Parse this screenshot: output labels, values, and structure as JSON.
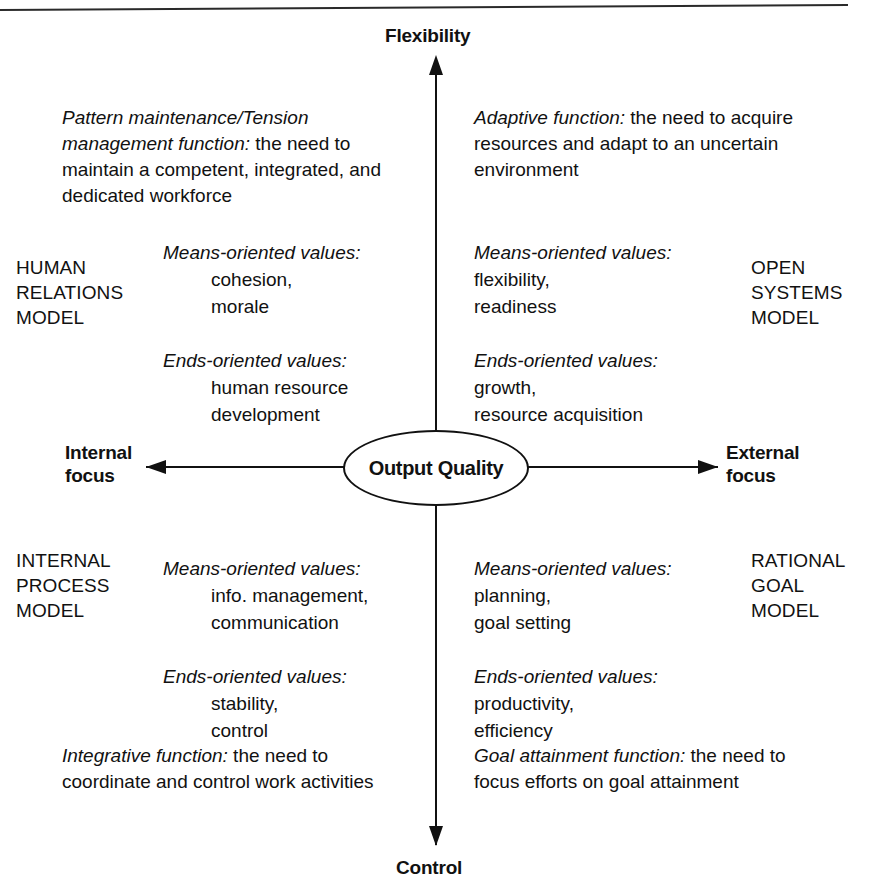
{
  "diagram": {
    "type": "quadrant-diagram",
    "center_node": {
      "label": "Output Quality",
      "shape": "ellipse"
    },
    "axes": {
      "vertical": {
        "top_label": "Flexibility",
        "bottom_label": "Control",
        "arrow_top": true,
        "arrow_bottom": true
      },
      "horizontal": {
        "left_label": "Internal\nfocus",
        "right_label": "External\nfocus",
        "arrow_left": true,
        "arrow_right": true
      }
    },
    "quadrants": {
      "upper_left": {
        "model_name": "HUMAN\nRELATIONS\nMODEL",
        "function": {
          "term": "Pattern maintenance/Tension management function:",
          "description": " the need to maintain a competent, integrated, and dedicated workforce"
        },
        "means_oriented": {
          "heading": "Means-oriented values:",
          "items": [
            "cohesion,",
            "morale"
          ]
        },
        "ends_oriented": {
          "heading": "Ends-oriented values:",
          "items": [
            "human resource",
            "development"
          ]
        }
      },
      "upper_right": {
        "model_name": "OPEN\nSYSTEMS\nMODEL",
        "function": {
          "term": "Adaptive function:",
          "description": " the need to acquire resources and adapt to an uncertain environment"
        },
        "means_oriented": {
          "heading": "Means-oriented values:",
          "items": [
            "flexibility,",
            "readiness"
          ]
        },
        "ends_oriented": {
          "heading": "Ends-oriented values:",
          "items": [
            "growth,",
            "resource acquisition"
          ]
        }
      },
      "lower_left": {
        "model_name": "INTERNAL\nPROCESS\nMODEL",
        "function": {
          "term": "Integrative function:",
          "description": " the need to coordinate and control work activities"
        },
        "means_oriented": {
          "heading": "Means-oriented values:",
          "items": [
            "info. management,",
            "communication"
          ]
        },
        "ends_oriented": {
          "heading": "Ends-oriented values:",
          "items": [
            "stability,",
            "control"
          ]
        }
      },
      "lower_right": {
        "model_name": "RATIONAL\nGOAL\nMODEL",
        "function": {
          "term": "Goal attainment function:",
          "description": " the need to focus efforts on goal attainment"
        },
        "means_oriented": {
          "heading": "Means-oriented values:",
          "items": [
            "planning,",
            "goal setting"
          ]
        },
        "ends_oriented": {
          "heading": "Ends-oriented values:",
          "items": [
            "productivity,",
            "efficiency"
          ]
        }
      }
    },
    "colors": {
      "ink": "#111111",
      "rule": "#2a2a2a",
      "background": "#ffffff"
    }
  }
}
